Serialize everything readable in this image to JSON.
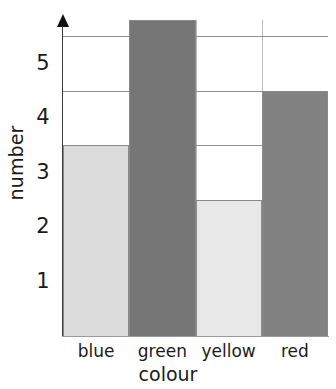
{
  "chart_data": {
    "type": "bar",
    "title": "",
    "subtitle": "",
    "xlabel": "colour",
    "ylabel": "number",
    "categories": [
      "blue",
      "green",
      "yellow",
      "red"
    ],
    "values": [
      3.5,
      5.8,
      2.5,
      4.5
    ],
    "ylim": [
      0,
      5.8
    ],
    "yticks": [
      "1",
      "2",
      "3",
      "4",
      "5"
    ],
    "ytick_values": [
      1,
      2,
      3,
      4,
      5
    ],
    "gridlines": [
      1.5,
      2.5,
      3.5,
      4.5,
      5.5
    ],
    "grid": true,
    "legend": "none",
    "bar_colors": [
      "#dcdcdc",
      "#767676",
      "#e8e8e8",
      "#828282"
    ],
    "bar_outline_color": "#8a8a8a",
    "axis_color": "#3a3a3a",
    "gridline_color": "#6e6e6e",
    "background": "#ffffff",
    "text_color": "#1a1a1a"
  },
  "axes": {
    "y_title": "number",
    "x_title": "colour",
    "y_tick_labels": [
      "1",
      "2",
      "3",
      "4",
      "5"
    ],
    "x_tick_labels": [
      "blue",
      "green",
      "yellow",
      "red"
    ]
  },
  "icons": {
    "axis_arrow": "arrow-up-icon"
  }
}
